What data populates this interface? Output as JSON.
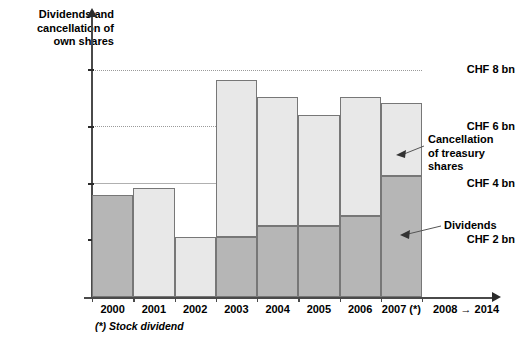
{
  "chart_data": {
    "type": "bar",
    "title": "Dividends and cancellation of own shares",
    "xlabel": "",
    "ylabel": "Dividends and cancellation of own shares",
    "ylim": [
      0,
      9
    ],
    "grid": true,
    "stacked": true,
    "categories": [
      "2000",
      "2001",
      "2002",
      "2003",
      "2004",
      "2005",
      "2006",
      "2007 (*)"
    ],
    "ytick_labels": [
      "CHF 8 bn",
      "CHF 6 bn",
      "CHF 4 bn",
      "CHF 2 bn"
    ],
    "ytick_values": [
      8,
      6,
      4,
      2
    ],
    "series": [
      {
        "name": "Dividends",
        "color": "#b6b6b6",
        "values": [
          3.6,
          0,
          0,
          2.1,
          2.5,
          2.5,
          2.85,
          4.25
        ]
      },
      {
        "name": "Cancellation of treasury shares",
        "color": "#e8e8e8",
        "values": [
          0,
          3.85,
          2.1,
          5.55,
          4.55,
          3.9,
          4.2,
          2.6
        ]
      }
    ],
    "totals": [
      3.6,
      3.85,
      2.1,
      7.65,
      7.05,
      6.4,
      7.05,
      6.85
    ],
    "annotations": [
      {
        "name": "cancellation-of-treasury-shares",
        "text": "Cancellation\nof treasury\nshares"
      },
      {
        "name": "dividends",
        "text": "Dividends"
      }
    ],
    "future_range_label": "2008 → 2014",
    "footnote": "(*) Stock dividend",
    "unit": "CHF bn"
  },
  "axis": {
    "title": "Dividends and\ncancellation of\nown shares"
  },
  "legend": {
    "cancellation_label": "Cancellation\nof treasury\nshares",
    "dividends_label": "Dividends"
  },
  "footer": {
    "footnote": "(*) Stock dividend",
    "future": "2008 → 2014"
  },
  "colors": {
    "dividends": "#b6b6b6",
    "cancellation": "#e8e8e8",
    "axis": "#4a4a4a",
    "gridline": "#9a9a9a",
    "text": "#000000"
  }
}
